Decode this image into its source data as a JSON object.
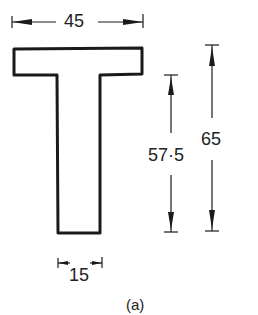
{
  "diagram": {
    "shape": "T-section",
    "dimensions": {
      "flange_width": "45",
      "stem_height": "57·5",
      "total_height": "65",
      "stem_width": "15"
    },
    "caption": "(a)",
    "colors": {
      "stroke": "#1a1a1a",
      "text": "#222222",
      "background": "#ffffff"
    }
  }
}
